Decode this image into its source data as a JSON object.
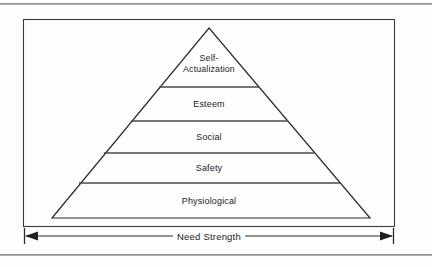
{
  "figure": {
    "type": "pyramid-hierarchy",
    "tiers": [
      {
        "id": "self-actualization",
        "label": "Self-\nActualization",
        "level": 5
      },
      {
        "id": "esteem",
        "label": "Esteem",
        "level": 4
      },
      {
        "id": "social",
        "label": "Social",
        "level": 3
      },
      {
        "id": "safety",
        "label": "Safety",
        "level": 2
      },
      {
        "id": "physiological",
        "label": "Physiological",
        "level": 1
      }
    ],
    "axis": {
      "label": "Need Strength",
      "arrow_style": "double-headed",
      "orientation": "horizontal",
      "position": "below-pyramid"
    },
    "colors": {
      "line": "#2b2b2b",
      "divider": "#555555",
      "frame": "#3a3a3a",
      "background": "#fefefe",
      "text": "#1c1c1c",
      "scan_rule": "#8e8e8e"
    }
  }
}
